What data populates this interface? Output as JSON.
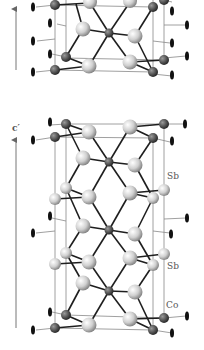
{
  "figure": {
    "top_structure": {
      "axis_arrow": {
        "x": 16,
        "y1": 70,
        "y2": 8
      }
    },
    "bottom_structure": {
      "axis_label": "c′",
      "axis_arrow": {
        "x": 16,
        "y1": 328,
        "y2": 140
      }
    },
    "labels": [
      {
        "id": "sb-upper",
        "text": "Sb",
        "x": 167,
        "y": 172
      },
      {
        "id": "sb-lower",
        "text": "Sb",
        "x": 167,
        "y": 262
      },
      {
        "id": "co",
        "text": "Co",
        "x": 166,
        "y": 301
      }
    ],
    "axis_label_pos": {
      "x": 12,
      "y": 124
    },
    "colors": {
      "co_atom": "#555555",
      "sb_atom": "#d8d8d8",
      "bond": "#222222",
      "cell_line": "#888888",
      "arrow": "#666666"
    }
  }
}
